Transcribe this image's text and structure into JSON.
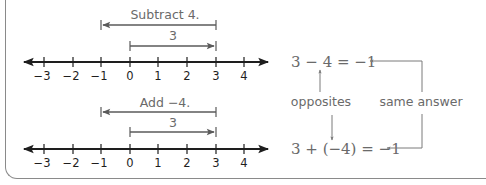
{
  "colors": {
    "axis": "#1e1e1e",
    "arrow": "#5a5a5a",
    "label": "#6a6a6a",
    "frame": "#8a8a8a"
  },
  "number_lines": [
    {
      "id": "top",
      "caption": "Subtract 4.",
      "move_label": "3",
      "ticks": [
        "−3",
        "−2",
        "−1",
        "0",
        "1",
        "2",
        "3",
        "4"
      ]
    },
    {
      "id": "bottom",
      "caption": "Add −4.",
      "move_label": "3",
      "ticks": [
        "−3",
        "−2",
        "−1",
        "0",
        "1",
        "2",
        "3",
        "4"
      ]
    }
  ],
  "equations": {
    "subtraction": "3 − 4 = −1",
    "addition": "3 + (−4) = −1"
  },
  "annotations": {
    "opposites": "opposites",
    "same_answer": "same answer"
  }
}
